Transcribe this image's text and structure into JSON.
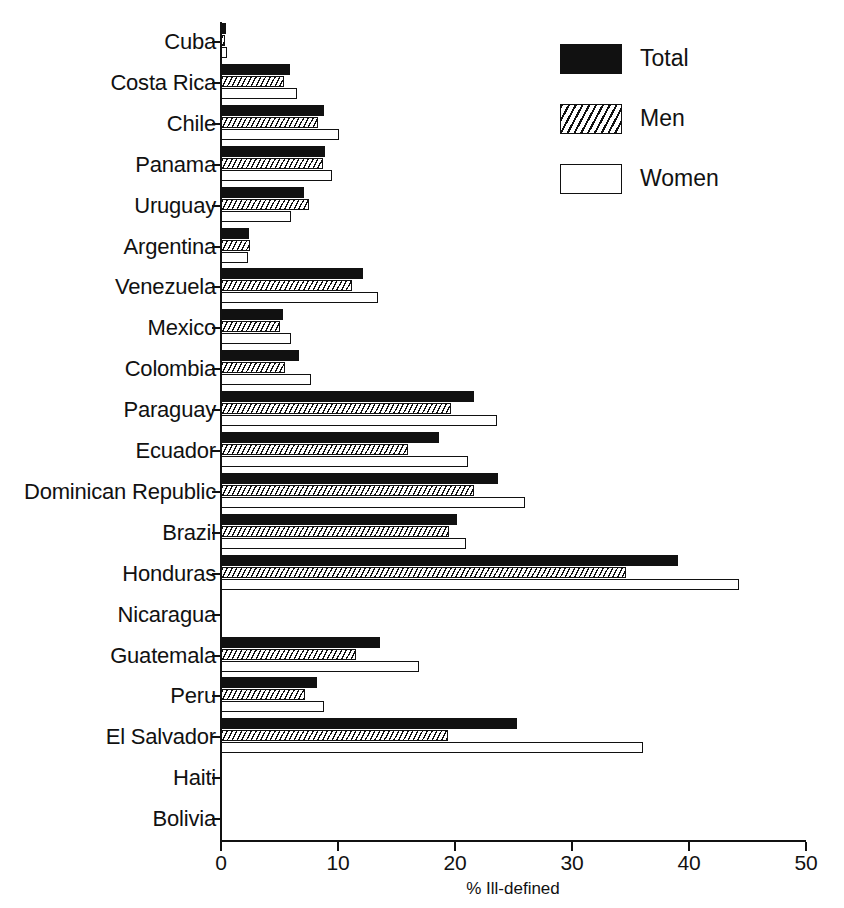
{
  "chart_data": {
    "type": "bar",
    "orientation": "horizontal",
    "title": "",
    "xlabel": "% Ill-defined",
    "ylabel": "",
    "xlim": [
      0,
      50
    ],
    "xticks": [
      0,
      10,
      20,
      30,
      40,
      50
    ],
    "xtick_labels": [
      "0",
      "10",
      "20",
      "30",
      "40",
      "50"
    ],
    "grid": false,
    "legend_position": "top-right",
    "categories": [
      "Cuba",
      "Costa Rica",
      "Chile",
      "Panama",
      "Uruguay",
      "Argentina",
      "Venezuela",
      "Mexico",
      "Colombia",
      "Paraguay",
      "Ecuador",
      "Dominican Republic",
      "Brazil",
      "Honduras",
      "Nicaragua",
      "Guatemala",
      "Peru",
      "El Salvador",
      "Haiti",
      "Bolivia"
    ],
    "series": [
      {
        "name": "Total",
        "fill": "solid-black",
        "color": "#111111",
        "values": [
          0.4,
          5.9,
          8.8,
          8.9,
          7.1,
          2.4,
          12.1,
          5.3,
          6.7,
          21.6,
          18.6,
          23.7,
          20.2,
          39.1,
          0,
          13.6,
          8.2,
          25.3,
          0,
          0
        ]
      },
      {
        "name": "Men",
        "fill": "hatched",
        "color": "#111111",
        "values": [
          0.3,
          5.4,
          8.3,
          8.7,
          7.5,
          2.5,
          11.2,
          5.0,
          5.5,
          19.7,
          16.0,
          21.6,
          19.5,
          34.6,
          0,
          11.5,
          7.2,
          19.4,
          0,
          0
        ]
      },
      {
        "name": "Women",
        "fill": "white",
        "color": "#ffffff",
        "values": [
          0.5,
          6.5,
          10.1,
          9.5,
          6.0,
          2.3,
          13.4,
          6.0,
          7.7,
          23.6,
          21.1,
          26.0,
          20.9,
          44.3,
          0,
          16.9,
          8.8,
          36.1,
          0,
          0
        ]
      }
    ]
  },
  "legend": {
    "items": [
      {
        "label": "Total"
      },
      {
        "label": "Men"
      },
      {
        "label": "Women"
      }
    ]
  },
  "axis": {
    "x_title": "% Ill-defined"
  }
}
